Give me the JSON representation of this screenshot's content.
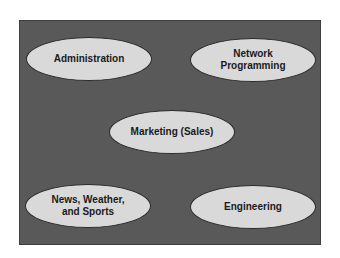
{
  "diagram": {
    "colors": {
      "background": "#595959",
      "node_fill": "#d9d9d9",
      "node_border": "#2a2a2a",
      "text": "#1a1a1a"
    },
    "nodes": [
      {
        "id": "administration",
        "label": "Administration"
      },
      {
        "id": "network-programming",
        "label": "Network\nProgramming"
      },
      {
        "id": "marketing",
        "label": "Marketing (Sales)"
      },
      {
        "id": "news",
        "label": "News, Weather,\nand Sports"
      },
      {
        "id": "engineering",
        "label": "Engineering"
      }
    ]
  }
}
